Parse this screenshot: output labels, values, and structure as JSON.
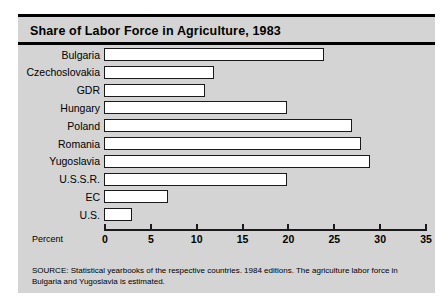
{
  "chart_data": {
    "type": "bar",
    "orientation": "horizontal",
    "title": "Share of Labor Force in Agriculture, 1983",
    "xlabel": "Percent",
    "ylabel": "",
    "categories": [
      "Bulgaria",
      "Czechoslovakia",
      "GDR",
      "Hungary",
      "Poland",
      "Romania",
      "Yugoslavia",
      "U.S.S.R.",
      "EC",
      "U.S."
    ],
    "values": [
      24,
      12,
      11,
      20,
      27,
      28,
      29,
      20,
      7,
      3
    ],
    "xlim": [
      0,
      35
    ],
    "xticks": [
      0,
      5,
      10,
      15,
      20,
      25,
      30,
      35
    ],
    "xticklabels": [
      "0",
      "5",
      "10",
      "15",
      "20",
      "25",
      "30",
      "35"
    ],
    "grid": false,
    "legend": false,
    "bar_facecolor": "#ffffff",
    "bar_edgecolor": "#1a1a1a",
    "panel_color": "#d4d4d4",
    "source": "SOURCE: Statistical yearbooks of the respective countries. 1984 editions. The agriculture labor force in Bulgaria and Yugoslavia is estimated."
  }
}
